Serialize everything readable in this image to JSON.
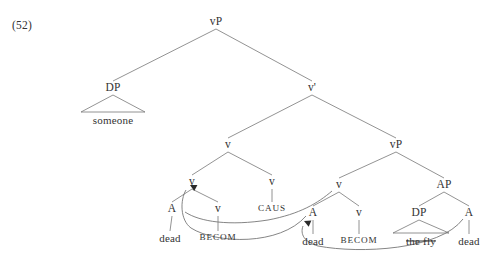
{
  "figure": {
    "example_number": "(52)",
    "caption": "",
    "ink_color": "#6f6f6f",
    "text_color": "#333333",
    "background_color": "#ffffff"
  },
  "tree": {
    "nodes": [
      {
        "id": "vP_top",
        "label": "vP",
        "x": 216,
        "y": 22,
        "style": "cat"
      },
      {
        "id": "DP_subj",
        "label": "DP",
        "x": 113,
        "y": 88,
        "style": "cat"
      },
      {
        "id": "someone",
        "label": "someone",
        "x": 113,
        "y": 120,
        "style": "terminal"
      },
      {
        "id": "vbar",
        "label": "v'",
        "x": 312,
        "y": 88,
        "style": "cat"
      },
      {
        "id": "v_mid",
        "label": "v",
        "x": 228,
        "y": 145,
        "style": "cat"
      },
      {
        "id": "vP_low",
        "label": "vP",
        "x": 396,
        "y": 145,
        "style": "cat"
      },
      {
        "id": "v_left",
        "label": "v",
        "x": 192,
        "y": 182,
        "style": "cat"
      },
      {
        "id": "v_caus",
        "label": "v",
        "x": 272,
        "y": 182,
        "style": "cat"
      },
      {
        "id": "A_left",
        "label": "A",
        "x": 172,
        "y": 209,
        "style": "cat"
      },
      {
        "id": "dead_left",
        "label": "dead",
        "x": 170,
        "y": 238,
        "style": "terminal"
      },
      {
        "id": "v_becom_l",
        "label": "v",
        "x": 218,
        "y": 209,
        "style": "cat"
      },
      {
        "id": "BECOM_left",
        "label": "BECOM",
        "x": 218,
        "y": 238,
        "style": "smallcaps"
      },
      {
        "id": "CAUS",
        "label": "CAUS",
        "x": 272,
        "y": 209,
        "style": "smallcaps"
      },
      {
        "id": "v_low",
        "label": "v",
        "x": 339,
        "y": 185,
        "style": "cat"
      },
      {
        "id": "AP",
        "label": "AP",
        "x": 444,
        "y": 185,
        "style": "cat"
      },
      {
        "id": "A_right",
        "label": "A",
        "x": 313,
        "y": 213,
        "style": "cat"
      },
      {
        "id": "dead_mid",
        "label": "dead",
        "x": 313,
        "y": 241,
        "style": "terminal"
      },
      {
        "id": "v_becom_r",
        "label": "v",
        "x": 359,
        "y": 213,
        "style": "cat"
      },
      {
        "id": "BECOM_right",
        "label": "BECOM",
        "x": 359,
        "y": 241,
        "style": "smallcaps"
      },
      {
        "id": "DP_obj",
        "label": "DP",
        "x": 419,
        "y": 213,
        "style": "cat"
      },
      {
        "id": "the_fly",
        "label": "the fly",
        "x": 421,
        "y": 241,
        "style": "terminal struck"
      },
      {
        "id": "A_far",
        "label": "A",
        "x": 469,
        "y": 213,
        "style": "cat"
      },
      {
        "id": "dead_right",
        "label": "dead",
        "x": 469,
        "y": 241,
        "style": "terminal"
      }
    ],
    "edges": [
      {
        "from": "vP_top",
        "to": "DP_subj"
      },
      {
        "from": "vP_top",
        "to": "vbar"
      },
      {
        "from": "DP_subj",
        "to": "someone",
        "shape": "triangle",
        "half_width": 32
      },
      {
        "from": "vbar",
        "to": "v_mid"
      },
      {
        "from": "vbar",
        "to": "vP_low"
      },
      {
        "from": "v_mid",
        "to": "v_left"
      },
      {
        "from": "v_mid",
        "to": "v_caus"
      },
      {
        "from": "v_left",
        "to": "A_left"
      },
      {
        "from": "v_left",
        "to": "v_becom_l"
      },
      {
        "from": "A_left",
        "to": "dead_left"
      },
      {
        "from": "v_becom_l",
        "to": "BECOM_left"
      },
      {
        "from": "v_caus",
        "to": "CAUS"
      },
      {
        "from": "vP_low",
        "to": "v_low"
      },
      {
        "from": "vP_low",
        "to": "AP"
      },
      {
        "from": "v_low",
        "to": "A_right"
      },
      {
        "from": "v_low",
        "to": "v_becom_r"
      },
      {
        "from": "A_right",
        "to": "dead_mid"
      },
      {
        "from": "v_becom_r",
        "to": "BECOM_right"
      },
      {
        "from": "AP",
        "to": "DP_obj"
      },
      {
        "from": "AP",
        "to": "A_far"
      },
      {
        "from": "DP_obj",
        "to": "the_fly",
        "shape": "triangle",
        "half_width": 28
      },
      {
        "from": "A_far",
        "to": "dead_right"
      }
    ],
    "movements": [
      {
        "id": "move-A-to-v-left",
        "from": "A_right",
        "to": "v_left",
        "description": "A raises to v (left complex head)",
        "path": "M 306 216 C 280 246 216 244 191 228 C 180 220 180 200 186 190",
        "arrow_at": {
          "x": 190,
          "y": 185,
          "angle": -62
        }
      },
      {
        "id": "move-A-to-v-low",
        "from": "A_far",
        "to": "A_right",
        "description": "A raises to v (lower complex head)",
        "path": "M 463 219 C 440 250 360 254 318 246 C 304 242 300 234 303 226",
        "arrow_at": {
          "x": 304,
          "y": 221,
          "angle": -66
        }
      },
      {
        "id": "move-v-low-left-branch",
        "from": "v_low",
        "to": "v_left_area",
        "description": "long arc from lower v region toward left v complex",
        "path": "M 332 191 C 318 203 300 214 268 220 C 230 226 200 222 185 212",
        "arrow_at": null
      }
    ]
  },
  "labels": {
    "heads": [
      "vP",
      "v'",
      "v",
      "AP",
      "A",
      "DP"
    ],
    "functional_heads": [
      "CAUS",
      "BECOM"
    ],
    "terminals": [
      "someone",
      "dead",
      "the fly"
    ]
  }
}
